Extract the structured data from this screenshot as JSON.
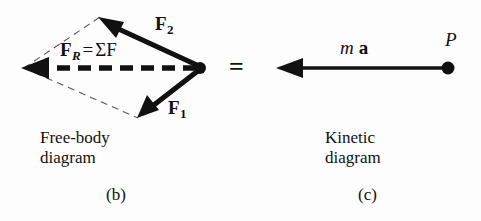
{
  "figure": {
    "background_color": "#fdfdfd",
    "ink_color": "#111111",
    "panels": [
      {
        "id": "free-body-diagram",
        "caption_line_1": "Free-body",
        "caption_line_2": "diagram",
        "panel_label": "(b)"
      },
      {
        "id": "kinetic-diagram",
        "caption_line_1": "Kinetic",
        "caption_line_2": "diagram",
        "panel_label": "(c)"
      }
    ],
    "equals_sign": "="
  },
  "free_body": {
    "vector_f2_label": "F",
    "vector_f2_subscript": "2",
    "vector_f1_label": "F",
    "vector_f1_subscript": "1",
    "resultant_symbol": "F",
    "resultant_subscript": "R",
    "resultant_equals": "=",
    "resultant_sum": "ΣF",
    "caption_line_1": "Free-body",
    "caption_line_2": "diagram",
    "panel_label": "(b)"
  },
  "kinetic": {
    "ma_mass": "m",
    "ma_accel": "a",
    "point_label": "P",
    "caption_line_1": "Kinetic",
    "caption_line_2": "diagram",
    "panel_label": "(c)"
  }
}
